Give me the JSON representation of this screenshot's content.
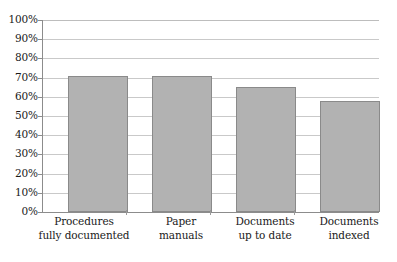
{
  "chart_data": {
    "type": "bar",
    "title": "",
    "subtitle": "",
    "xlabel": "",
    "ylabel": "",
    "categories": [
      "Procedures fully documented",
      "Paper manuals",
      "Documents up to date",
      "Documents indexed"
    ],
    "category_lines": [
      [
        "Procedures",
        "fully documented"
      ],
      [
        "Paper",
        "manuals"
      ],
      [
        "Documents",
        "up to date"
      ],
      [
        "Documents",
        "indexed"
      ]
    ],
    "values": [
      71,
      71,
      65,
      58
    ],
    "value_labels": [
      "71%",
      "71%",
      "65%",
      "58%"
    ],
    "ylim": [
      0,
      100
    ],
    "ytick_step": 10,
    "ytick_labels": [
      "100%",
      "90%",
      "80%",
      "70%",
      "60%",
      "50%",
      "40%",
      "30%",
      "20%",
      "10%",
      "0%"
    ],
    "ytick_values": [
      100,
      90,
      80,
      70,
      60,
      50,
      40,
      30,
      20,
      10,
      0
    ],
    "grid": true,
    "grid_orientation": "horizontal",
    "legend": false,
    "legend_position": "none",
    "colors": {
      "bar_fill": "#b2b2b2",
      "bar_border": "#8a8a8a",
      "gridline": "#c9c9c9",
      "axis": "#8c8c8c",
      "text": "#1a1a1a",
      "background": "#ffffff"
    }
  }
}
